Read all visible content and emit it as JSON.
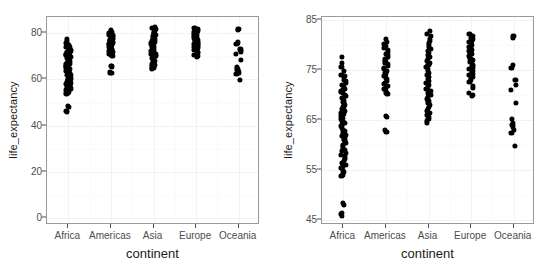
{
  "figure": {
    "background_color": "#ffffff",
    "panel_background_color": "#ffffff",
    "panel_border_color": "#9a9a9a",
    "gridline_major_color": "#f2f2f2",
    "gridline_minor_color": "#fafafa",
    "point_color": "#000000",
    "axis_text_color": "#4d4d4d",
    "axis_title_color": "#1a1a1a"
  },
  "chart_data": [
    {
      "id": "left",
      "type": "scatter",
      "plot_style": "strip-dotplot",
      "title": "",
      "xlabel": "continent",
      "ylabel": "life_expectancy",
      "grid": true,
      "legend": "none",
      "categories": [
        "Africa",
        "Americas",
        "Asia",
        "Europe",
        "Oceania"
      ],
      "xtick_labels": [
        "Africa",
        "Americas",
        "Asia",
        "Europe",
        "Oceania"
      ],
      "ylim": [
        -3,
        87
      ],
      "ytick_labels": [
        "0",
        "20",
        "40",
        "60",
        "80"
      ],
      "ytick_values": [
        0,
        20,
        40,
        60,
        80
      ],
      "yminor_values": [
        10,
        30,
        50,
        70
      ],
      "series": [
        {
          "name": "Africa",
          "values": [
            77.6,
            76.4,
            75.7,
            74.8,
            74.1,
            73.9,
            73.6,
            73.0,
            72.8,
            72.4,
            72.0,
            71.6,
            71.3,
            71.0,
            70.8,
            70.6,
            70.4,
            70.1,
            69.8,
            69.4,
            69.0,
            68.7,
            68.4,
            68.0,
            67.6,
            67.3,
            66.9,
            66.5,
            66.2,
            65.9,
            65.5,
            65.2,
            64.8,
            64.5,
            64.1,
            63.8,
            63.5,
            63.1,
            62.8,
            62.4,
            62.1,
            61.8,
            61.5,
            61.1,
            60.8,
            60.4,
            60.1,
            59.8,
            59.4,
            59.1,
            58.8,
            58.5,
            58.1,
            57.8,
            57.5,
            57.2,
            56.9,
            56.5,
            56.1,
            55.8,
            55.4,
            55.0,
            54.7,
            54.4,
            54.1,
            53.9,
            48.5,
            48.0,
            46.5,
            46.2,
            45.9
          ]
        },
        {
          "name": "Americas",
          "values": [
            81.2,
            80.7,
            80.2,
            79.8,
            79.4,
            79.0,
            78.7,
            78.3,
            78.0,
            77.6,
            77.2,
            76.9,
            76.5,
            76.2,
            75.9,
            75.5,
            75.2,
            74.9,
            74.5,
            74.2,
            73.9,
            73.5,
            73.2,
            72.9,
            72.5,
            72.2,
            71.9,
            71.5,
            71.2,
            70.9,
            70.5,
            70.2,
            65.9,
            65.6,
            63.0,
            62.7
          ]
        },
        {
          "name": "Asia",
          "values": [
            82.8,
            82.3,
            81.8,
            81.3,
            80.9,
            80.5,
            80.0,
            79.6,
            79.2,
            78.8,
            78.4,
            78.0,
            77.6,
            77.2,
            76.8,
            76.4,
            76.0,
            75.6,
            75.2,
            74.8,
            74.4,
            74.0,
            73.6,
            73.2,
            72.8,
            72.4,
            72.0,
            71.6,
            71.2,
            70.8,
            70.4,
            70.0,
            69.6,
            69.2,
            68.8,
            68.4,
            68.0,
            67.6,
            67.2,
            66.8,
            66.4,
            66.0,
            65.6,
            65.2,
            64.8,
            64.4
          ]
        },
        {
          "name": "Europe",
          "values": [
            82.2,
            81.8,
            81.5,
            81.2,
            80.9,
            80.6,
            80.3,
            80.0,
            79.7,
            79.4,
            79.1,
            78.8,
            78.5,
            78.2,
            77.9,
            77.6,
            77.3,
            77.0,
            76.7,
            76.4,
            76.1,
            75.8,
            75.5,
            75.2,
            74.9,
            74.6,
            74.3,
            74.0,
            73.7,
            73.4,
            73.0,
            72.6,
            71.8,
            71.4,
            70.5,
            70.0,
            69.8
          ]
        },
        {
          "name": "Oceania",
          "values": [
            81.9,
            81.4,
            76.0,
            75.4,
            73.0,
            72.1,
            71.0,
            68.5,
            65.2,
            64.5,
            64.1,
            63.6,
            63.0,
            62.5,
            59.8
          ]
        }
      ]
    },
    {
      "id": "right",
      "type": "scatter",
      "plot_style": "strip-dotplot",
      "title": "",
      "xlabel": "continent",
      "ylabel": "life_expectancy",
      "grid": true,
      "legend": "none",
      "categories": [
        "Africa",
        "Americas",
        "Asia",
        "Europe",
        "Oceania"
      ],
      "xtick_labels": [
        "Africa",
        "Americas",
        "Asia",
        "Europe",
        "Oceania"
      ],
      "ylim": [
        44.0,
        85.6
      ],
      "ytick_labels": [
        "45",
        "55",
        "65",
        "75",
        "85"
      ],
      "ytick_values": [
        45,
        55,
        65,
        75,
        85
      ],
      "yminor_values": [
        50,
        60,
        70,
        80
      ],
      "series": [
        {
          "name": "Africa",
          "values": [
            77.6,
            76.4,
            75.7,
            74.8,
            74.1,
            73.9,
            73.6,
            73.0,
            72.8,
            72.4,
            72.0,
            71.6,
            71.3,
            71.0,
            70.8,
            70.6,
            70.4,
            70.1,
            69.8,
            69.4,
            69.0,
            68.7,
            68.4,
            68.0,
            67.6,
            67.3,
            66.9,
            66.5,
            66.2,
            65.9,
            65.5,
            65.2,
            64.8,
            64.5,
            64.1,
            63.8,
            63.5,
            63.1,
            62.8,
            62.4,
            62.1,
            61.8,
            61.5,
            61.1,
            60.8,
            60.4,
            60.1,
            59.8,
            59.4,
            59.1,
            58.8,
            58.5,
            58.1,
            57.8,
            57.5,
            57.2,
            56.9,
            56.5,
            56.1,
            55.8,
            55.4,
            55.0,
            54.7,
            54.4,
            54.1,
            53.9,
            48.5,
            48.0,
            46.5,
            46.2,
            45.9
          ]
        },
        {
          "name": "Americas",
          "values": [
            81.2,
            80.7,
            80.2,
            79.8,
            79.4,
            79.0,
            78.7,
            78.3,
            78.0,
            77.6,
            77.2,
            76.9,
            76.5,
            76.2,
            75.9,
            75.5,
            75.2,
            74.9,
            74.5,
            74.2,
            73.9,
            73.5,
            73.2,
            72.9,
            72.5,
            72.2,
            71.9,
            71.5,
            71.2,
            70.9,
            70.5,
            70.2,
            65.9,
            65.6,
            63.0,
            62.7
          ]
        },
        {
          "name": "Asia",
          "values": [
            82.8,
            82.3,
            81.8,
            81.3,
            80.9,
            80.5,
            80.0,
            79.6,
            79.2,
            78.8,
            78.4,
            78.0,
            77.6,
            77.2,
            76.8,
            76.4,
            76.0,
            75.6,
            75.2,
            74.8,
            74.4,
            74.0,
            73.6,
            73.2,
            72.8,
            72.4,
            72.0,
            71.6,
            71.2,
            70.8,
            70.4,
            70.0,
            69.6,
            69.2,
            68.8,
            68.4,
            68.0,
            67.6,
            67.2,
            66.8,
            66.4,
            66.0,
            65.6,
            65.2,
            64.8,
            64.4
          ]
        },
        {
          "name": "Europe",
          "values": [
            82.2,
            81.8,
            81.5,
            81.2,
            80.9,
            80.6,
            80.3,
            80.0,
            79.7,
            79.4,
            79.1,
            78.8,
            78.5,
            78.2,
            77.9,
            77.6,
            77.3,
            77.0,
            76.7,
            76.4,
            76.1,
            75.8,
            75.5,
            75.2,
            74.9,
            74.6,
            74.3,
            74.0,
            73.7,
            73.4,
            73.0,
            72.6,
            71.8,
            71.4,
            70.5,
            70.0,
            69.8
          ]
        },
        {
          "name": "Oceania",
          "values": [
            81.9,
            81.4,
            76.0,
            75.4,
            73.0,
            72.1,
            71.0,
            68.5,
            65.2,
            64.5,
            64.1,
            63.6,
            63.0,
            62.5,
            59.8
          ]
        }
      ]
    }
  ]
}
